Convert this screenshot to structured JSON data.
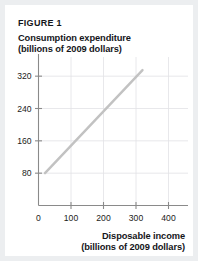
{
  "figure": {
    "number_label": "FIGURE 1",
    "y_axis_title_line1": "Consumption expenditure",
    "y_axis_title_line2": "(billions of 2009 dollars)",
    "x_axis_title_line1": "Disposable income",
    "x_axis_title_line2": "(billions of 2009 dollars)",
    "panel_background": "#ffffff",
    "page_background": "#eceef0",
    "text_color": "#15161a",
    "line_color": "#c2c2c2",
    "axis_color": "#8a8a8a",
    "grid_color": "#e2e2e6"
  },
  "chart_data": {
    "type": "line",
    "title": "Consumption expenditure (billions of 2009 dollars)",
    "xlabel": "Disposable income (billions of 2009 dollars)",
    "ylabel": "Consumption expenditure (billions of 2009 dollars)",
    "xlim": [
      0,
      460
    ],
    "ylim": [
      0,
      360
    ],
    "xticks": [
      0,
      100,
      200,
      300,
      400
    ],
    "xtick_labels": [
      "0",
      "100",
      "200",
      "300",
      "400"
    ],
    "yticks": [
      80,
      160,
      240,
      320
    ],
    "ytick_labels": [
      "80",
      "160",
      "240",
      "320"
    ],
    "grid": true,
    "legend": null,
    "series": [
      {
        "name": "Consumption function",
        "x": [
          20,
          320
        ],
        "y": [
          80,
          335
        ],
        "color": "#c2c2c2"
      }
    ]
  }
}
